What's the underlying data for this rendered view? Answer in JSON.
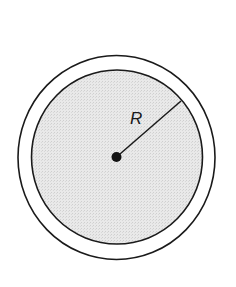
{
  "diagram": {
    "radius_label": "R",
    "colors": {
      "stroke": "#1a1a1a",
      "fill_inner": "#e6e6e6",
      "ring": "#ffffff",
      "background": "#ffffff"
    },
    "geometry": {
      "center": [
        116.5,
        157.5
      ],
      "outer_radius": [
        98.5,
        102
      ],
      "inner_radius": [
        85.5,
        87
      ],
      "radius_line_end": [
        180,
        102
      ],
      "center_dot_radius": 5
    }
  }
}
